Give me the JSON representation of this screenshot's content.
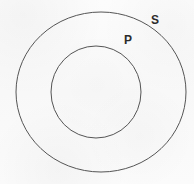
{
  "diagram": {
    "type": "euler-diagram",
    "background_color": "#fbfbfb",
    "stroke_color": "#555555",
    "label_color": "#2b2b2b",
    "shapes": [
      {
        "id": "outer-circle",
        "name": "S",
        "shape": "circle",
        "center_x": 101,
        "center_y": 92,
        "radius_x": 85,
        "radius_y": 80,
        "fill": "none",
        "stroke_width": 1
      },
      {
        "id": "inner-circle",
        "name": "P",
        "shape": "circle",
        "center_x": 96,
        "center_y": 92,
        "radius_x": 45,
        "radius_y": 46,
        "fill": "none",
        "stroke_width": 1
      }
    ],
    "labels": {
      "outer": "S",
      "inner": "P"
    }
  }
}
